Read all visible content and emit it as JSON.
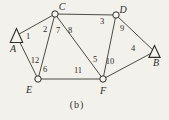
{
  "figure": {
    "caption": "(b)"
  },
  "colors": {
    "ink": "#2f2d29",
    "paper": "#f6f4ef",
    "edge": "#3a3833"
  },
  "graph": {
    "nodes": [
      {
        "id": "A",
        "shape": "triangle",
        "x": 16.5,
        "y": 35.5,
        "hw": 6.2,
        "hh": 7.0,
        "label": "A",
        "lx": 13,
        "ly": 48
      },
      {
        "id": "B",
        "shape": "triangle",
        "x": 154.5,
        "y": 51.5,
        "hw": 5.6,
        "hh": 5.9,
        "label": "B",
        "lx": 156,
        "ly": 62
      },
      {
        "id": "C",
        "shape": "circle",
        "x": 55,
        "y": 14,
        "r": 3.2,
        "label": "C",
        "lx": 62,
        "ly": 6
      },
      {
        "id": "D",
        "shape": "circle",
        "x": 116,
        "y": 15,
        "r": 3.2,
        "label": "D",
        "lx": 123,
        "ly": 9
      },
      {
        "id": "E",
        "shape": "circle",
        "x": 38,
        "y": 79,
        "r": 3.2,
        "label": "E",
        "lx": 29,
        "ly": 89
      },
      {
        "id": "F",
        "shape": "circle",
        "x": 103,
        "y": 79,
        "r": 3.2,
        "label": "F",
        "lx": 103,
        "ly": 90
      }
    ],
    "edges": [
      [
        "A",
        "C"
      ],
      [
        "A",
        "E"
      ],
      [
        "C",
        "E"
      ],
      [
        "C",
        "D"
      ],
      [
        "C",
        "F"
      ],
      [
        "D",
        "F"
      ],
      [
        "D",
        "B"
      ],
      [
        "E",
        "F"
      ],
      [
        "F",
        "B"
      ]
    ],
    "corner_labels": [
      {
        "text": "1",
        "x": 28,
        "y": 36
      },
      {
        "text": "2",
        "x": 45,
        "y": 29
      },
      {
        "text": "7",
        "x": 58,
        "y": 30
      },
      {
        "text": "8",
        "x": 70,
        "y": 30
      },
      {
        "text": "3",
        "x": 102,
        "y": 21
      },
      {
        "text": "9",
        "x": 122,
        "y": 28
      },
      {
        "text": "4",
        "x": 133,
        "y": 48
      },
      {
        "text": "5",
        "x": 95,
        "y": 59
      },
      {
        "text": "10",
        "x": 110,
        "y": 61
      },
      {
        "text": "11",
        "x": 78,
        "y": 70
      },
      {
        "text": "12",
        "x": 35,
        "y": 60
      },
      {
        "text": "6",
        "x": 45,
        "y": 69
      }
    ]
  }
}
